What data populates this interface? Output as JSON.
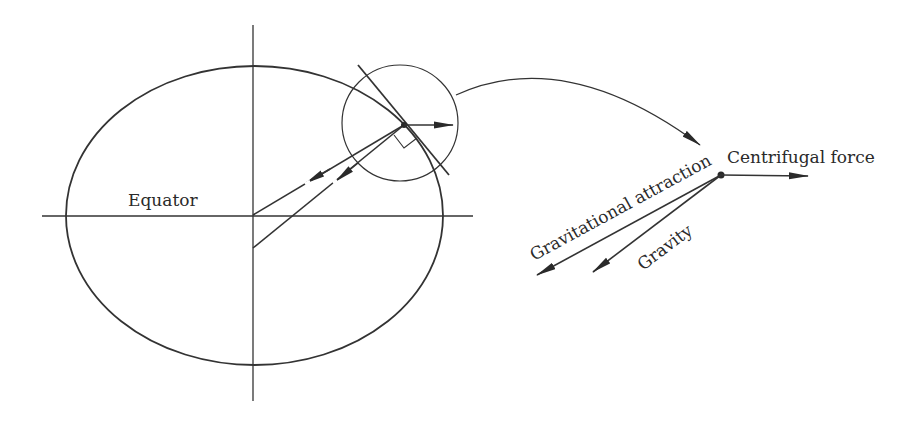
{
  "diagram": {
    "labels": {
      "equator": "Equator",
      "centrifugal_force": "Centrifugal force",
      "gravitational_attraction": "Gravitational attraction",
      "gravity": "Gravity"
    },
    "colors": {
      "stroke": "#333333",
      "text": "#2a2a2a",
      "background": "#ffffff"
    },
    "elements": [
      "earth-ellipse",
      "equator-axis",
      "polar-axis",
      "tangent-line",
      "magnify-circle",
      "right-angle-marker",
      "curved-pointer-arrow",
      "force-vector-diagram"
    ]
  }
}
